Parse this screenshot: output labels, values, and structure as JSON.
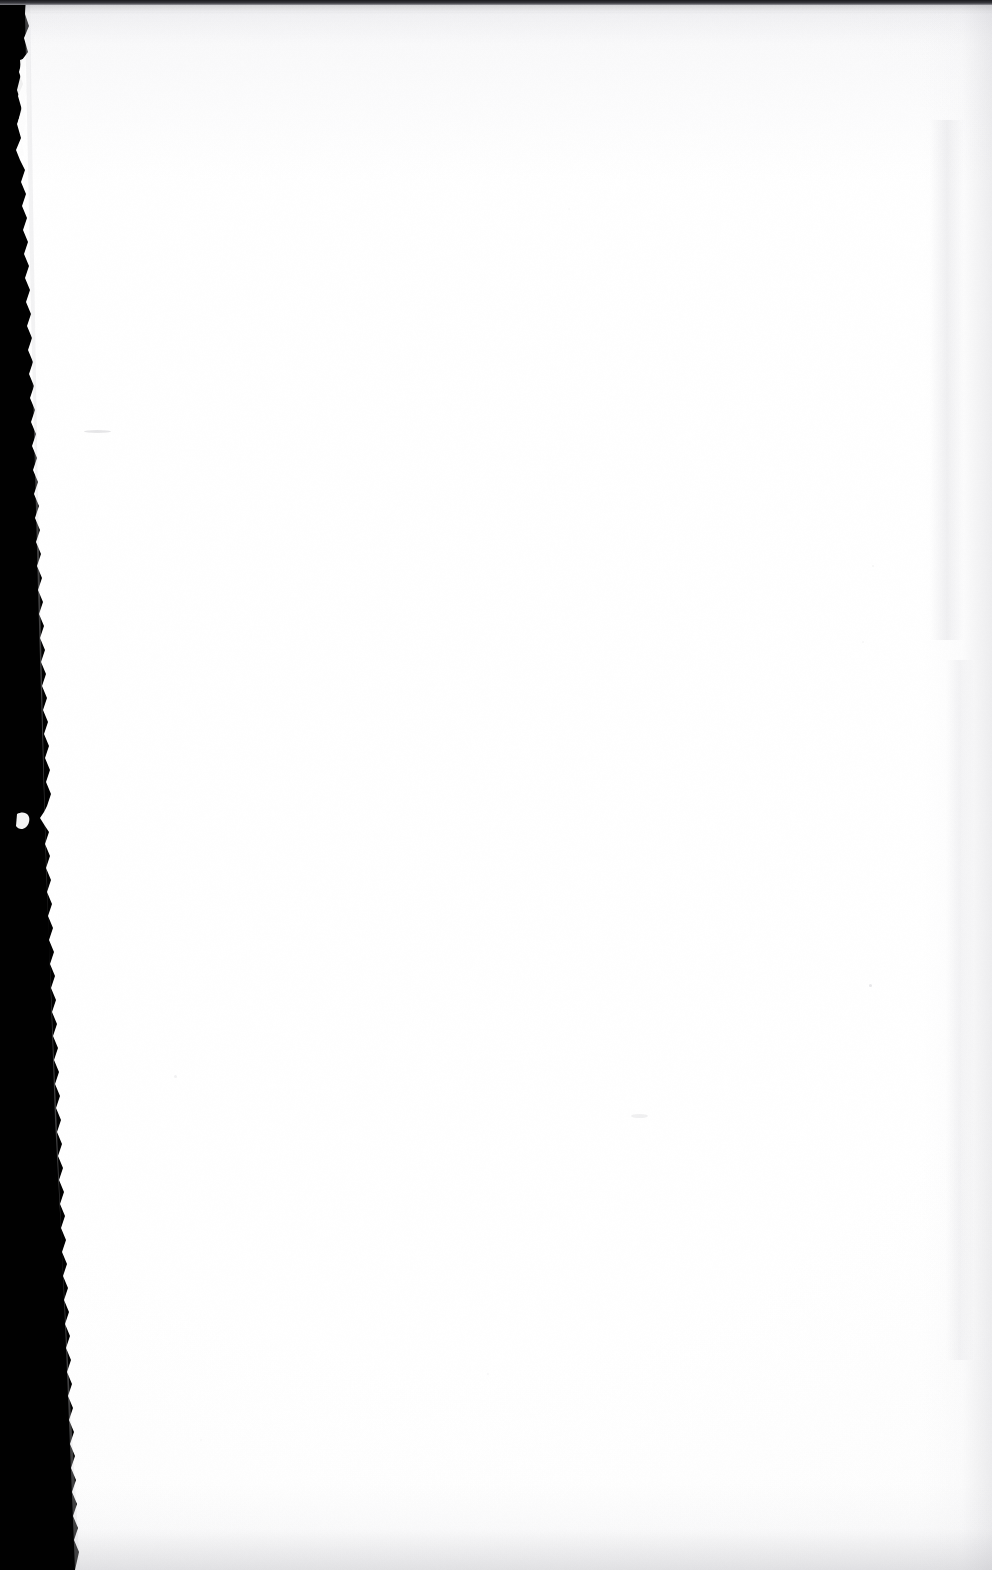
{
  "document": {
    "kind": "scanned-book-page",
    "page_state": "blank",
    "visible_text": "",
    "note": "Blank scanned leaf — no printed text, headings, folios or figures are rendered in the pixels."
  },
  "canvas": {
    "width_px": 992,
    "height_px": 1570
  },
  "colors": {
    "scanner_backdrop": "#010101",
    "paper_white": "#ffffff",
    "paper_offwhite": "#fafafa",
    "top_rule_dark": "#1a1a1e",
    "top_rule_mid": "#3a3a40",
    "edge_shadow_gray": "#c4c4ca",
    "bottom_shadow_gray": "#babac0",
    "mark_gray": "#b9b9bd",
    "speck_gray": "#c9c9cd",
    "smudge_gray": "#a8a8ae"
  },
  "regions": {
    "scanner_backdrop_label": "scanner background",
    "paper_label": "blank page",
    "left_torn_edge_label": "torn left paper edge",
    "top_rule_label": "scan top edge rule",
    "right_vignette_label": "right edge shadow",
    "bottom_vignette_label": "bottom edge shadow"
  },
  "artifacts": {
    "marks": [
      {
        "name": "pencil-smudge-upper-left",
        "x": 84,
        "y": 431,
        "w": 27,
        "h": 3,
        "opacity": 0.34
      },
      {
        "name": "pencil-smudge-mid-page",
        "x": 631,
        "y": 1115,
        "w": 17,
        "h": 4,
        "opacity": 0.22
      }
    ],
    "specks": [
      {
        "name": "speck-right-upper",
        "x": 869,
        "y": 984,
        "d": 3,
        "opacity": 0.3
      },
      {
        "name": "speck-left-lower",
        "x": 174,
        "y": 1075,
        "d": 3,
        "opacity": 0.22
      },
      {
        "name": "speck-right-edge",
        "x": 872,
        "y": 565,
        "d": 2,
        "opacity": 0.18
      },
      {
        "name": "speck-upper-right",
        "x": 862,
        "y": 641,
        "d": 2,
        "opacity": 0.16
      },
      {
        "name": "speck-center-low",
        "x": 487,
        "y": 1373,
        "d": 2,
        "opacity": 0.14
      },
      {
        "name": "speck-top-center",
        "x": 568,
        "y": 208,
        "d": 2,
        "opacity": 0.12
      },
      {
        "name": "speck-bottom-left",
        "x": 200,
        "y": 1439,
        "d": 2,
        "opacity": 0.12
      }
    ],
    "torn_edge": {
      "name": "left-torn-edge",
      "min_width_px": 14,
      "max_width_px": 32,
      "white_flap": {
        "x": 18,
        "y": 62,
        "w": 9,
        "h": 96
      },
      "white_nub": {
        "x": 17,
        "y": 812,
        "w": 12,
        "h": 17
      }
    }
  }
}
